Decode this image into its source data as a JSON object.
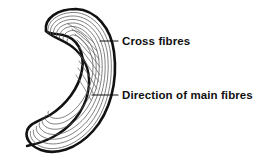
{
  "figure": {
    "background_color": "#ffffff",
    "outline_color": "#111111",
    "fibre_color": "#555555",
    "cross_fibre_color": "#666666",
    "leader_color": "#111111"
  },
  "labels": [
    {
      "id": "cross-fibres",
      "text": "Cross fibres",
      "text_x": 122,
      "text_y": 41,
      "leader_from_x": 100,
      "leader_from_y": 41,
      "leader_to_x": 118,
      "leader_to_y": 41
    },
    {
      "id": "direction-of-main-fibres",
      "text": "Direction of main fibres",
      "text_x": 122,
      "text_y": 95,
      "leader_from_x": 92,
      "leader_from_y": 95,
      "leader_to_x": 118,
      "leader_to_y": 95
    }
  ],
  "shape": {
    "name": "crescent-body",
    "outer_path": "M 44 28 C 46 16 60 8 76 9 C 94 10 107 26 110 48 C 114 76 108 106 92 126 C 76 146 56 152 42 148 C 32 145 27 138 28 132 C 30 126 38 124 46 120 C 62 112 76 94 80 74 C 84 54 78 38 64 34 C 54 31 47 33 44 28 Z",
    "inner_notch_path": "M 44 28 C 50 34 62 36 72 44 C 84 54 88 66 86 80 C 83 100 70 116 54 124 C 44 129 34 130 30 133",
    "main_fibre_count": 7,
    "cross_fibre_count": 9
  }
}
